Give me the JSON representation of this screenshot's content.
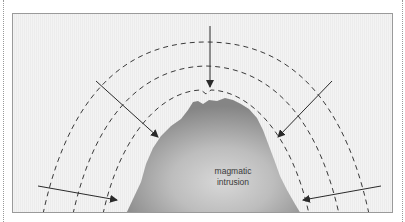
{
  "diagram": {
    "label_line1": "magmatic",
    "label_line2": "intrusion",
    "colors": {
      "background": "#ececec",
      "border": "#9a9a9a",
      "dashes": "#3a3a3a",
      "arrows": "#2a2a2a",
      "intrusion_dark": "#8a8a8a",
      "intrusion_light": "#d4d4d4"
    },
    "elements": {
      "dashed_arcs": 3,
      "arrows": 5
    }
  }
}
